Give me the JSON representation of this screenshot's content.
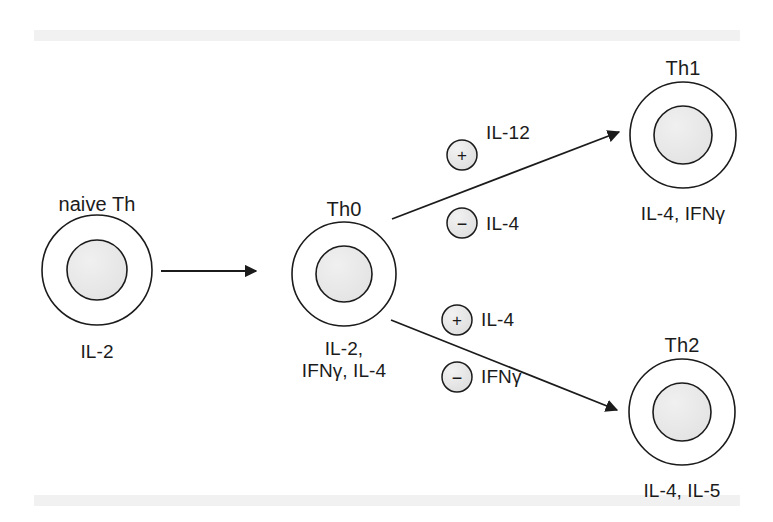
{
  "figure": {
    "title_text": "",
    "background_color": "#ffffff",
    "scan_band_color": "#f1f1f1",
    "line_color": "#1b1b1b",
    "nucleus_fill": "#e9e9e9",
    "membrane_fill": "#ffffff"
  },
  "cells": [
    {
      "id": "naive-th",
      "name": "naive Th",
      "cytokines": [
        "IL-2"
      ],
      "cx": 97,
      "cy": 270,
      "outer_r": 55,
      "inner_r": 30,
      "label_y": 193,
      "cytokine_y": 341
    },
    {
      "id": "th0",
      "name": "Th0",
      "cytokines": [
        "IL-2,",
        "IFNγ, IL-4"
      ],
      "cx": 344,
      "cy": 274,
      "outer_r": 52,
      "inner_r": 28,
      "label_y": 198,
      "cytokine_y": 338
    },
    {
      "id": "th1",
      "name": "Th1",
      "cytokines": [
        "IL-4, IFNγ"
      ],
      "cx": 683,
      "cy": 135,
      "outer_r": 53,
      "inner_r": 29,
      "label_y": 57,
      "cytokine_y": 203
    },
    {
      "id": "th2",
      "name": "Th2",
      "cytokines": [
        "IL-4, IL-5"
      ],
      "cx": 682,
      "cy": 412,
      "outer_r": 53,
      "inner_r": 29,
      "label_y": 334,
      "cytokine_y": 480
    }
  ],
  "arrows": [
    {
      "id": "naive-to-th0",
      "from": "naive-th",
      "to": "th0",
      "x1": 161,
      "y1": 271,
      "x2": 256,
      "y2": 271
    },
    {
      "id": "th0-to-th1",
      "from": "th0",
      "to": "th1",
      "x1": 392,
      "y1": 219,
      "x2": 619,
      "y2": 132
    },
    {
      "id": "th0-to-th2",
      "from": "th0",
      "to": "th2",
      "x1": 391,
      "y1": 320,
      "x2": 617,
      "y2": 410
    }
  ],
  "signals": [
    {
      "id": "th1-positive",
      "sign": "+",
      "cytokine": "IL-12",
      "cx": 462,
      "cy": 155,
      "r": 15,
      "label_x": 486,
      "label_y": 133
    },
    {
      "id": "th1-negative",
      "sign": "−",
      "cytokine": "IL-4",
      "cx": 462,
      "cy": 223,
      "r": 15,
      "label_x": 486,
      "label_y": 224
    },
    {
      "id": "th2-positive",
      "sign": "+",
      "cytokine": "IL-4",
      "cx": 457,
      "cy": 320,
      "r": 15,
      "label_x": 481,
      "label_y": 320
    },
    {
      "id": "th2-negative",
      "sign": "−",
      "cytokine": "IFNγ",
      "cx": 457,
      "cy": 377,
      "r": 15,
      "label_x": 481,
      "label_y": 377
    }
  ]
}
